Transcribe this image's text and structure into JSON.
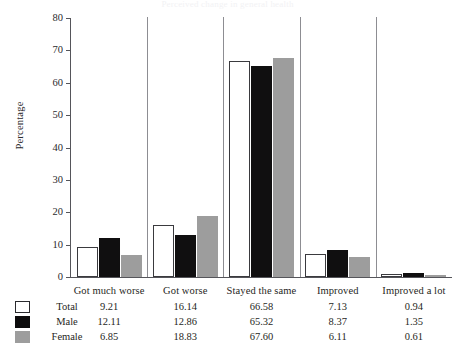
{
  "chart": {
    "title": "Perceived change in general health",
    "ylabel": "Percentage"
  },
  "chart_data": {
    "type": "bar",
    "title": "Perceived change in general health",
    "xlabel": "",
    "ylabel": "Percentage",
    "ylim": [
      0,
      80
    ],
    "yticks": [
      0,
      10,
      20,
      30,
      40,
      50,
      60,
      70,
      80
    ],
    "grid": false,
    "legend": "bottom-table",
    "categories": [
      "Got much worse",
      "Got worse",
      "Stayed the same",
      "Improved",
      "Improved a lot"
    ],
    "series": [
      {
        "name": "Total",
        "color": "#ffffff",
        "values": [
          9.21,
          16.14,
          66.58,
          7.13,
          0.94
        ],
        "labels": [
          "9.21",
          "16.14",
          "66.58",
          "7.13",
          "0.94"
        ]
      },
      {
        "name": "Male",
        "color": "#0d0c0d",
        "values": [
          12.11,
          12.86,
          65.32,
          8.37,
          1.35
        ],
        "labels": [
          "12.11",
          "12.86",
          "65.32",
          "8.37",
          "1.35"
        ]
      },
      {
        "name": "Female",
        "color": "#9d9d9d",
        "values": [
          6.85,
          18.83,
          67.6,
          6.11,
          0.61
        ],
        "labels": [
          "6.85",
          "18.83",
          "67.60",
          "6.11",
          "0.61"
        ]
      }
    ]
  },
  "yticks": {
    "t0": "0",
    "t10": "10",
    "t20": "20",
    "t30": "30",
    "t40": "40",
    "t50": "50",
    "t60": "60",
    "t70": "70",
    "t80": "80"
  }
}
